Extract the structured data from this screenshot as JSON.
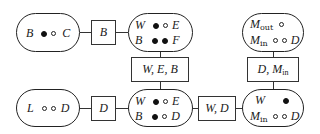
{
  "diagram": {
    "top_row": {
      "node1": {
        "label_left": "B",
        "label_right": "C",
        "dots": [
          "filled",
          "empty"
        ]
      },
      "edge1": {
        "label": "B"
      },
      "node2": {
        "row1": {
          "label_left": "W",
          "dots": [
            "filled",
            "empty"
          ],
          "label_right": "E"
        },
        "row2": {
          "label_left": "B",
          "dots": [
            "filled",
            "filled"
          ],
          "label_right": "F"
        }
      },
      "node3": {
        "row1": {
          "label_left": "M",
          "label_left_sub": "out",
          "dots": [
            "empty"
          ]
        },
        "row2": {
          "label_left": "M",
          "label_left_sub": "in",
          "dots": [
            "empty",
            "empty"
          ],
          "label_right": "D"
        }
      }
    },
    "vertical_edges": {
      "middle": {
        "label": "W, E, B"
      },
      "right": {
        "label_main": "D, M",
        "label_sub": "in"
      }
    },
    "bottom_row": {
      "node1": {
        "label_left": "L",
        "label_right": "D",
        "dots": [
          "empty",
          "empty"
        ]
      },
      "edge1": {
        "label": "D"
      },
      "node2": {
        "row1": {
          "label_left": "W",
          "dots": [
            "filled",
            "empty"
          ],
          "label_right": "E"
        },
        "row2": {
          "label_left": "B",
          "dots": [
            "filled",
            "empty"
          ],
          "label_right": "D"
        }
      },
      "edge2": {
        "label": "W, D"
      },
      "node3": {
        "row1": {
          "label_left": "W",
          "dots": [
            "filled"
          ]
        },
        "row2": {
          "label_left": "M",
          "label_left_sub": "in",
          "dots": [
            "empty",
            "empty"
          ],
          "label_right": "D"
        }
      }
    }
  }
}
